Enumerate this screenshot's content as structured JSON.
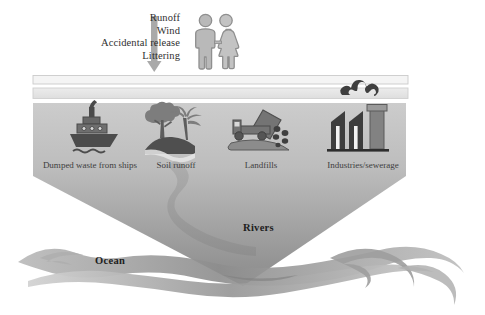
{
  "figure": {
    "inputs": {
      "lines": [
        "Runoff",
        "Wind",
        "Accidental release",
        "Littering"
      ],
      "arrow_icon": "down-arrow-icon",
      "people_icon": "people-pair-icon"
    },
    "bands": [
      {
        "name": "upper-thin-band",
        "fill": "#f2f2f2",
        "stroke": "#cfcfcf"
      },
      {
        "name": "lower-thin-band",
        "fill": "#e8e8e8",
        "stroke": "#d3d3d3"
      }
    ],
    "sources": [
      {
        "id": "ships",
        "label": "Dumped waste from ships",
        "icon": "ship-icon"
      },
      {
        "id": "soil",
        "label": "Soil runoff",
        "icon": "tree-hill-icon"
      },
      {
        "id": "landfills",
        "label": "Landfills",
        "icon": "dump-truck-icon"
      },
      {
        "id": "industries",
        "label": "Industries/sewerage",
        "icon": "factory-icon"
      }
    ],
    "smoke_icon": "smoke-cloud-icon",
    "river_icon": "winding-river-icon",
    "waves_icon": "ocean-waves-icon",
    "zones": [
      {
        "id": "rivers",
        "label": "Rivers"
      },
      {
        "id": "ocean",
        "label": "Ocean"
      }
    ],
    "colors": {
      "funnel_top": "#c9c9c9",
      "funnel_bottom": "#8e8e8e",
      "icon_dark": "#4e4e4e",
      "icon_mid": "#6e6e6e",
      "icon_light": "#9d9d9d",
      "text": "#2f2f2f",
      "wave_dark": "#8a8a8a",
      "wave_light": "#c6c6c6"
    }
  }
}
